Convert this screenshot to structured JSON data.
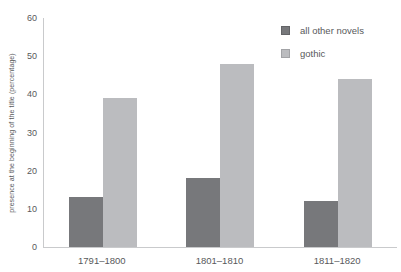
{
  "chart_data": {
    "type": "bar",
    "categories": [
      "1791–1800",
      "1801–1810",
      "1811–1820"
    ],
    "series": [
      {
        "name": "all other novels",
        "values": [
          13,
          18,
          12
        ],
        "color": "#77787b",
        "swatch_border": "#636467"
      },
      {
        "name": "gothic",
        "values": [
          39,
          48,
          44
        ],
        "color": "#bbbcbf",
        "swatch_border": "#a2a3a6"
      }
    ],
    "title": "",
    "xlabel": "",
    "ylabel": "presence at the beginning of the title (percentage)",
    "ylim": [
      0,
      60
    ],
    "yticks": [
      0,
      10,
      20,
      30,
      40,
      50,
      60
    ],
    "grid": false,
    "legend_position": "top-right",
    "axis_color": "#c9cacc",
    "text_color": "#58595b"
  }
}
